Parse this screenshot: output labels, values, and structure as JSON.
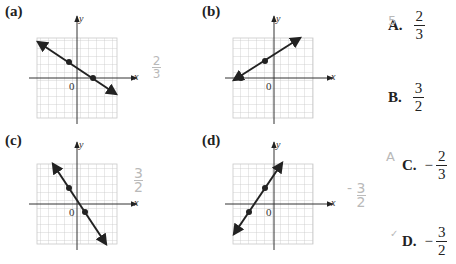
{
  "graphs": [
    {
      "id": "a",
      "label": "(a)",
      "x_axis_label": "x",
      "y_axis_label": "y",
      "origin_label": "0",
      "points": [
        [
          -1,
          2
        ],
        [
          2,
          0
        ]
      ],
      "slope": "-2/3"
    },
    {
      "id": "b",
      "label": "(b)",
      "x_axis_label": "x",
      "y_axis_label": "y",
      "origin_label": "0",
      "points": [
        [
          -4,
          0
        ],
        [
          -1,
          2
        ]
      ],
      "slope": "2/3"
    },
    {
      "id": "c",
      "label": "(c)",
      "x_axis_label": "x",
      "y_axis_label": "y",
      "origin_label": "0",
      "points": [
        [
          -1,
          2
        ],
        [
          1,
          -1
        ]
      ],
      "slope": "-3/2"
    },
    {
      "id": "d",
      "label": "(d)",
      "x_axis_label": "x",
      "y_axis_label": "y",
      "origin_label": "0",
      "points": [
        [
          -3,
          -1
        ],
        [
          -1,
          2
        ]
      ],
      "slope": "3/2"
    }
  ],
  "choices": [
    {
      "letter": "A.",
      "sign": "",
      "numerator": "2",
      "denominator": "3"
    },
    {
      "letter": "B.",
      "sign": "",
      "numerator": "3",
      "denominator": "2"
    },
    {
      "letter": "C.",
      "sign": "−",
      "numerator": "2",
      "denominator": "3"
    },
    {
      "letter": "D.",
      "sign": "−",
      "numerator": "3",
      "denominator": "2"
    }
  ],
  "handwriting": {
    "mark_a": "5",
    "note_a": {
      "numerator": "2",
      "denominator": "3"
    },
    "note_c": {
      "numerator": "3",
      "denominator": "2"
    },
    "mark_c": "A",
    "note_d": {
      "sign": "-",
      "numerator": "3",
      "denominator": "2"
    },
    "mark_d": "✓"
  }
}
